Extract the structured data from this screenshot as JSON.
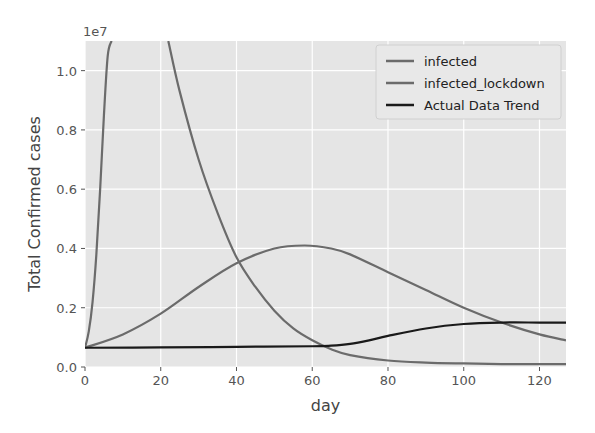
{
  "chart_data": {
    "type": "line",
    "title": "",
    "xlabel": "day",
    "ylabel": "Total Confirmed cases",
    "y_offset_label": "1e7",
    "xlim": [
      0,
      127
    ],
    "ylim": [
      0,
      1.1
    ],
    "xticks": [
      0,
      20,
      40,
      60,
      80,
      100,
      120
    ],
    "yticks": [
      0.0,
      0.2,
      0.4,
      0.6,
      0.8,
      1.0
    ],
    "ytick_labels": [
      "0.0",
      "0.2",
      "0.4",
      "0.6",
      "0.8",
      "1.0"
    ],
    "grid": true,
    "legend_position": "top-right",
    "series": [
      {
        "name": "infected",
        "color": "#6b6b6b",
        "x": [
          0,
          1,
          2,
          3,
          4,
          5,
          6,
          7
        ],
        "y": [
          0.065,
          0.12,
          0.22,
          0.38,
          0.6,
          0.85,
          1.05,
          1.2
        ]
      },
      {
        "name": "infected_lockdown",
        "color": "#6b6b6b",
        "x": [
          0,
          10,
          20,
          30,
          40,
          50,
          58,
          65,
          70,
          80,
          90,
          100,
          110,
          120,
          127
        ],
        "y": [
          0.065,
          0.11,
          0.18,
          0.27,
          0.35,
          0.4,
          0.41,
          0.4,
          0.38,
          0.32,
          0.26,
          0.2,
          0.15,
          0.11,
          0.09
        ]
      },
      {
        "name": "infected_lockdown_decline",
        "color": "#6b6b6b",
        "x": [
          22,
          25,
          30,
          35,
          40,
          45,
          50,
          55,
          60,
          65,
          70,
          80,
          90,
          100,
          110,
          120,
          127
        ],
        "y": [
          1.1,
          0.93,
          0.7,
          0.52,
          0.37,
          0.27,
          0.19,
          0.13,
          0.09,
          0.06,
          0.04,
          0.022,
          0.015,
          0.012,
          0.01,
          0.01,
          0.01
        ]
      },
      {
        "name": "Actual Data Trend",
        "color": "#1a1a1a",
        "x": [
          0,
          20,
          40,
          60,
          65,
          70,
          75,
          80,
          90,
          100,
          110,
          120,
          127
        ],
        "y": [
          0.065,
          0.066,
          0.068,
          0.07,
          0.072,
          0.078,
          0.09,
          0.105,
          0.13,
          0.145,
          0.15,
          0.15,
          0.15
        ]
      }
    ]
  },
  "legend": [
    {
      "label": "infected",
      "color": "#6b6b6b"
    },
    {
      "label": "infected_lockdown",
      "color": "#6b6b6b"
    },
    {
      "label": "Actual Data Trend",
      "color": "#1a1a1a"
    }
  ]
}
